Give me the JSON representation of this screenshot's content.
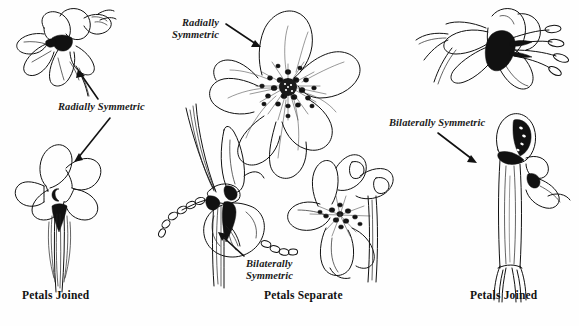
{
  "figure": {
    "background_color": "#ffffff",
    "ink_color": "#111111"
  },
  "annotations": [
    {
      "id": "radially-symmetric-left",
      "text": "Radially Symmetric",
      "style": "italic",
      "lines": [
        "Radially Symmetric"
      ],
      "points_to": [
        "lily-side-view",
        "five-petal-joined-flower"
      ]
    },
    {
      "id": "radially-symmetric-center",
      "text": "Radially Symmetric",
      "style": "italic",
      "lines": [
        "Radially",
        "Symmetric"
      ],
      "points_to": [
        "large-five-petal-separate-flower"
      ]
    },
    {
      "id": "bilaterally-symmetric-center",
      "text": "Bilaterally Symmetric",
      "style": "italic",
      "lines": [
        "Bilaterally",
        "Symmetric"
      ],
      "points_to": [
        "orchid-flower"
      ]
    },
    {
      "id": "bilaterally-symmetric-right",
      "text": "Bilaterally Symmetric",
      "style": "italic",
      "lines": [
        "Bilaterally Symmetric"
      ],
      "points_to": [
        "tubular-hooded-flower"
      ]
    }
  ],
  "captions": [
    {
      "id": "caption-left",
      "text": "Petals Joined",
      "column": "left"
    },
    {
      "id": "caption-center",
      "text": "Petals Separate",
      "column": "center"
    },
    {
      "id": "caption-right",
      "text": "Petals Joined",
      "column": "right"
    }
  ],
  "specimens": [
    {
      "id": "lily-side-view",
      "column": "left",
      "symmetry": "radial",
      "petal_fusion": "joined",
      "view": "side"
    },
    {
      "id": "five-petal-joined-flower",
      "column": "left",
      "symmetry": "radial",
      "petal_fusion": "joined",
      "view": "face-on",
      "petal_count": 5
    },
    {
      "id": "large-five-petal-separate-flower",
      "column": "center",
      "symmetry": "radial",
      "petal_fusion": "separate",
      "view": "face-on",
      "petal_count": 5
    },
    {
      "id": "orchid-flower",
      "column": "center",
      "symmetry": "bilateral",
      "petal_fusion": "separate",
      "view": "side"
    },
    {
      "id": "lipped-flower",
      "column": "center",
      "symmetry": "bilateral",
      "petal_fusion": "separate",
      "view": "three-quarter"
    },
    {
      "id": "tubular-stamen-flower",
      "column": "right",
      "symmetry": "bilateral",
      "petal_fusion": "joined",
      "view": "side"
    },
    {
      "id": "tubular-hooded-flower",
      "column": "right",
      "symmetry": "bilateral",
      "petal_fusion": "joined",
      "view": "side"
    }
  ]
}
